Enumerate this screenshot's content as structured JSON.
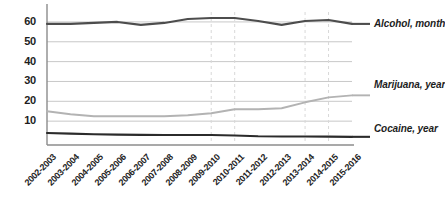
{
  "chart_data": {
    "type": "line",
    "title": "",
    "xlabel": "",
    "ylabel": "",
    "ylim": [
      0,
      65
    ],
    "yticks": [
      10,
      20,
      30,
      40,
      50,
      60
    ],
    "grid": true,
    "legend_position": "right-inline",
    "categories": [
      "2002-2003",
      "2003-2004",
      "2004-2005",
      "2005-2006",
      "2006-2007",
      "2007-2008",
      "2008-2009",
      "2009-2010",
      "2010-2011",
      "2011-2012",
      "2012-2013",
      "2013-2014",
      "2014-2015",
      "2015-2016"
    ],
    "series": [
      {
        "name": "Alcohol, month",
        "color": "#4d4d4d",
        "values": [
          59,
          59,
          59.5,
          60,
          58.5,
          59.5,
          61.5,
          62,
          62,
          60.5,
          58.5,
          60.5,
          61,
          59
        ]
      },
      {
        "name": "Marijuana, year",
        "color": "#b3b3b3",
        "values": [
          15,
          13.5,
          12.5,
          12.5,
          12.5,
          12.5,
          13,
          14,
          16,
          16,
          16.5,
          19.5,
          22,
          23
        ]
      },
      {
        "name": "Cocaine, year",
        "color": "#2b2b2b",
        "values": [
          4,
          3.7,
          3.4,
          3.2,
          3.1,
          3,
          3,
          3,
          2.8,
          2.4,
          2.3,
          2.3,
          2.2,
          2.1
        ]
      }
    ]
  },
  "axis": {
    "ytick_labels": [
      "60",
      "50",
      "40",
      "30",
      "20",
      "10"
    ],
    "xtick_labels": [
      "2002-2003",
      "2003-2004",
      "2004-2005",
      "2005-2006",
      "2006-2007",
      "2007-2008",
      "2008-2009",
      "2009-2010",
      "2010-2011",
      "2011-2012",
      "2012-2013",
      "2013-2014",
      "2014-2015",
      "2015-2016"
    ]
  },
  "legend": {
    "items": [
      {
        "label": "Alcohol, month"
      },
      {
        "label": "Marijuana, year"
      },
      {
        "label": "Cocaine, year"
      }
    ]
  },
  "colors": {
    "alcohol": "#4d4d4d",
    "marijuana": "#b3b3b3",
    "cocaine": "#2b2b2b",
    "gridline": "#c8c8c8",
    "axis": "#8c8c8c",
    "vgrid": "#d8d8d8"
  }
}
